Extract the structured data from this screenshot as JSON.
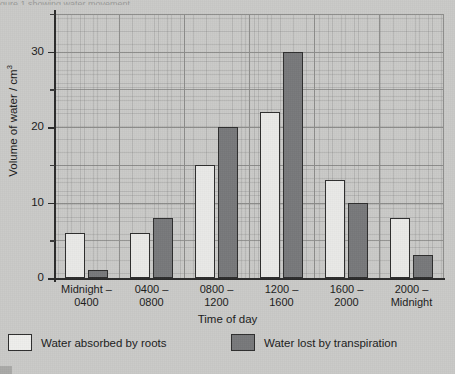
{
  "figure": {
    "background_color": "#c9c9c7",
    "ink_color": "#1b1b1b",
    "top_cropped_text": "gure 1 showing water movement"
  },
  "chart_data": {
    "type": "bar",
    "title": "",
    "xlabel": "Time of day",
    "ylabel": "Volume of water / cm³",
    "categories": [
      "Midnight – 0400",
      "0400 – 0800",
      "0800 – 1200",
      "1200 – 1600",
      "1600 – 2000",
      "2000 – Midnight"
    ],
    "category_lines": [
      [
        "Midnight –",
        "0400"
      ],
      [
        "0400 –",
        "0800"
      ],
      [
        "0800 –",
        "1200"
      ],
      [
        "1200 –",
        "1600"
      ],
      [
        "1600 –",
        "2000"
      ],
      [
        "2000 –",
        "Midnight"
      ]
    ],
    "series": [
      {
        "name": "Water absorbed by roots",
        "color": "#e9e9e7",
        "values": [
          6,
          6,
          15,
          22,
          13,
          8
        ]
      },
      {
        "name": "Water lost by transpiration",
        "color": "#77787a",
        "values": [
          1,
          8,
          20,
          30,
          10,
          3
        ]
      }
    ],
    "ylim": [
      0,
      35
    ],
    "yticks_major": [
      0,
      10,
      20,
      30
    ],
    "ytick_labels": [
      "0",
      "10",
      "20",
      "30"
    ],
    "yticks_minor": [
      5,
      15,
      25,
      35
    ],
    "grid": true,
    "grid_style": "graph-paper",
    "legend_position": "below-plot"
  },
  "legend": {
    "items": [
      {
        "label": "Water absorbed by roots",
        "swatch": "light"
      },
      {
        "label": "Water lost by transpiration",
        "swatch": "dark"
      }
    ]
  }
}
